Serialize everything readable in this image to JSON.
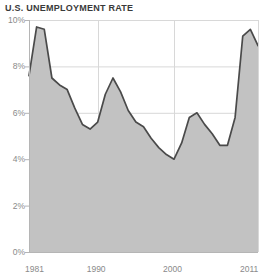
{
  "chart": {
    "title": "U.S. UNEMPLOYMENT RATE"
  },
  "colors": {
    "area_fill": "#c2c2c2",
    "line": "#4a4a4a",
    "grid": "#d8d8d8",
    "axis": "#b5b5b5",
    "tick_text": "#8a8a8a",
    "title_text": "#3a3a3a",
    "background": "#ffffff"
  },
  "axes": {
    "y_ticks": [
      "0%",
      "2%",
      "4%",
      "6%",
      "8%",
      "10%"
    ],
    "y_tick_values": [
      0,
      2,
      4,
      6,
      8,
      10
    ],
    "x_ticks": [
      "1981",
      "1990",
      "2000",
      "2011"
    ],
    "x_tick_values": [
      1981,
      1990,
      2000,
      2011
    ]
  },
  "chart_data": {
    "type": "area",
    "title": "U.S. UNEMPLOYMENT RATE",
    "xlabel": "",
    "ylabel": "",
    "xlim": [
      1981,
      2011
    ],
    "ylim": [
      0,
      10
    ],
    "grid": true,
    "legend": "none",
    "x": [
      1981,
      1982,
      1983,
      1984,
      1985,
      1986,
      1987,
      1988,
      1989,
      1990,
      1991,
      1992,
      1993,
      1994,
      1995,
      1996,
      1997,
      1998,
      1999,
      2000,
      2001,
      2002,
      2003,
      2004,
      2005,
      2006,
      2007,
      2008,
      2009,
      2010,
      2011
    ],
    "values": [
      7.6,
      9.7,
      9.6,
      7.5,
      7.2,
      7.0,
      6.2,
      5.5,
      5.3,
      5.6,
      6.8,
      7.5,
      6.9,
      6.1,
      5.6,
      5.4,
      4.9,
      4.5,
      4.2,
      4.0,
      4.7,
      5.8,
      6.0,
      5.5,
      5.1,
      4.6,
      4.6,
      5.8,
      9.3,
      9.6,
      8.9
    ],
    "categories": [
      "1981",
      "1982",
      "1983",
      "1984",
      "1985",
      "1986",
      "1987",
      "1988",
      "1989",
      "1990",
      "1991",
      "1992",
      "1993",
      "1994",
      "1995",
      "1996",
      "1997",
      "1998",
      "1999",
      "2000",
      "2001",
      "2002",
      "2003",
      "2004",
      "2005",
      "2006",
      "2007",
      "2008",
      "2009",
      "2010",
      "2011"
    ],
    "series": [
      {
        "name": "U.S. Unemployment Rate",
        "values": [
          7.6,
          9.7,
          9.6,
          7.5,
          7.2,
          7.0,
          6.2,
          5.5,
          5.3,
          5.6,
          6.8,
          7.5,
          6.9,
          6.1,
          5.6,
          5.4,
          4.9,
          4.5,
          4.2,
          4.0,
          4.7,
          5.8,
          6.0,
          5.5,
          5.1,
          4.6,
          4.6,
          5.8,
          9.3,
          9.6,
          8.9
        ]
      }
    ]
  }
}
